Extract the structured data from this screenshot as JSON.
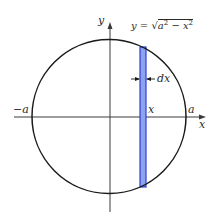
{
  "diagram": {
    "type": "circle-area-strip",
    "colors": {
      "line": "#1a1a1a",
      "axis": "#3a3a3a",
      "strip_fill": "#8fa2f0",
      "strip_stroke": "#2a3fd6",
      "background": "#ffffff"
    },
    "labels": {
      "y_axis": "y",
      "x_axis": "x",
      "neg_a": "−a",
      "pos_a": "a",
      "x_mark": "x",
      "dx": "dx",
      "equation_lhs": "y = ",
      "equation_radical": "√",
      "equation_radicand_a": "a",
      "equation_exp_a": "2",
      "equation_minus": " − x",
      "equation_exp_x": "2"
    }
  }
}
